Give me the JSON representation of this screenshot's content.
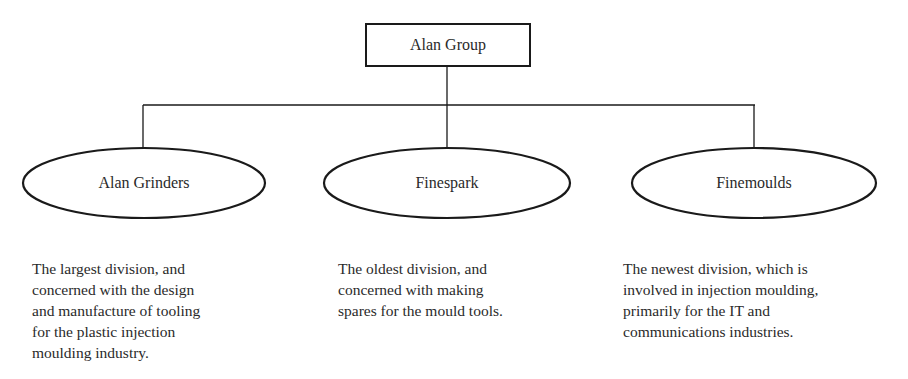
{
  "diagram": {
    "caption_partial": "",
    "root": {
      "label": "Alan Group"
    },
    "divisions": [
      {
        "name": "Alan Grinders",
        "description": "The largest division, and\nconcerned with the design\nand manufacture of tooling\nfor the plastic injection\nmoulding industry."
      },
      {
        "name": "Finespark",
        "description": "The oldest division, and\nconcerned with making\nspares for the mould tools."
      },
      {
        "name": "Finemoulds",
        "description": "The newest division, which is\ninvolved in injection moulding,\nprimarily for the IT and\ncommunications industries."
      }
    ],
    "colors": {
      "stroke": "#1a1a1a",
      "text": "#2a2a2a",
      "background": "#ffffff"
    }
  }
}
